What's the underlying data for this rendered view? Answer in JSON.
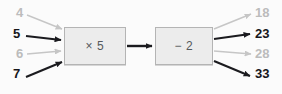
{
  "diagram": {
    "type": "function-machine",
    "title": "",
    "background_color": "#fbfbfb",
    "colors": {
      "strong": "#16161a",
      "faded": "#bcbcbc",
      "box_fill": "#ececec",
      "box_border": "#b4b4b4",
      "box_label": "#55595c"
    },
    "operations": [
      {
        "id": "multiply",
        "label": "× 5",
        "operator": "×",
        "operand": "5"
      },
      {
        "id": "subtract",
        "label": "− 2",
        "operator": "−",
        "operand": "2"
      }
    ],
    "inputs": [
      {
        "value": "4",
        "emphasis": "faded"
      },
      {
        "value": "5",
        "emphasis": "strong"
      },
      {
        "value": "6",
        "emphasis": "faded"
      },
      {
        "value": "7",
        "emphasis": "strong"
      }
    ],
    "outputs": [
      {
        "value": "18",
        "emphasis": "faded"
      },
      {
        "value": "23",
        "emphasis": "strong"
      },
      {
        "value": "28",
        "emphasis": "faded"
      },
      {
        "value": "33",
        "emphasis": "strong"
      }
    ]
  }
}
